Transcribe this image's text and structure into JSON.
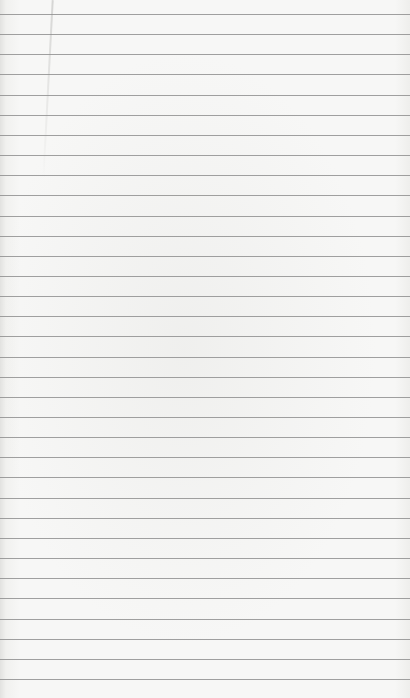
{
  "page": {
    "type": "lined-paper",
    "background_color": "#f6f6f5",
    "line_color": "#8f8f8f",
    "first_line_y": 14,
    "line_spacing": 20.15,
    "line_count": 34,
    "text": ""
  }
}
